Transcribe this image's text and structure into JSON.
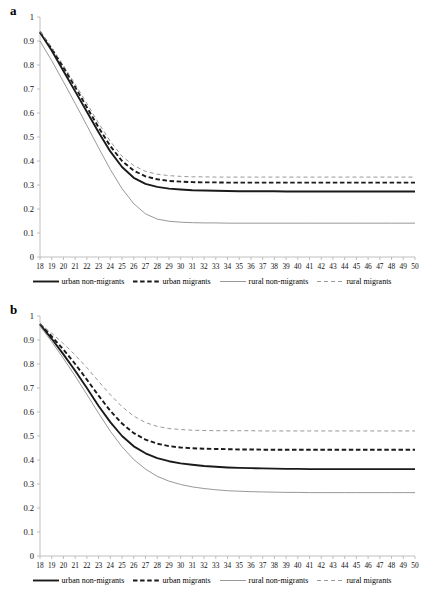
{
  "figure": {
    "panels": [
      {
        "label": "a"
      },
      {
        "label": "b"
      }
    ]
  },
  "legend": {
    "entries": [
      {
        "label": "urban non-migrants",
        "style": "solid",
        "color": "#1a1a1a",
        "width": 1.9
      },
      {
        "label": "urban migrants",
        "style": "dashed",
        "color": "#1a1a1a",
        "width": 1.9
      },
      {
        "label": "rural non-migrants",
        "style": "solid",
        "color": "#8c8c8c",
        "width": 0.9
      },
      {
        "label": "rural migrants",
        "style": "dashed",
        "color": "#8c8c8c",
        "width": 0.9
      }
    ]
  },
  "chart_data": [
    {
      "type": "line",
      "title": "a",
      "xlabel": "",
      "ylabel": "",
      "xlim": [
        18,
        50
      ],
      "ylim": [
        0,
        1
      ],
      "grid": false,
      "legend_position": "bottom",
      "xticks": [
        18,
        19,
        20,
        21,
        22,
        23,
        24,
        25,
        26,
        27,
        28,
        29,
        30,
        31,
        32,
        33,
        34,
        35,
        36,
        37,
        38,
        39,
        40,
        41,
        42,
        43,
        44,
        45,
        46,
        47,
        48,
        49,
        50
      ],
      "yticks": [
        0,
        0.1,
        0.2,
        0.3,
        0.4,
        0.5,
        0.6,
        0.7,
        0.8,
        0.9,
        1
      ],
      "x": [
        18,
        19,
        20,
        21,
        22,
        23,
        24,
        25,
        26,
        27,
        28,
        29,
        30,
        31,
        32,
        33,
        34,
        35,
        36,
        37,
        38,
        39,
        40,
        41,
        42,
        43,
        44,
        45,
        46,
        47,
        48,
        49,
        50
      ],
      "series": [
        {
          "name": "urban non-migrants",
          "style": "solid",
          "color": "#1a1a1a",
          "values": [
            0.935,
            0.86,
            0.775,
            0.69,
            0.605,
            0.52,
            0.44,
            0.375,
            0.33,
            0.305,
            0.292,
            0.285,
            0.281,
            0.278,
            0.277,
            0.276,
            0.275,
            0.274,
            0.274,
            0.274,
            0.274,
            0.273,
            0.273,
            0.273,
            0.273,
            0.273,
            0.273,
            0.273,
            0.273,
            0.273,
            0.273,
            0.273,
            0.273
          ]
        },
        {
          "name": "urban migrants",
          "style": "dashed",
          "color": "#1a1a1a",
          "values": [
            0.938,
            0.868,
            0.79,
            0.708,
            0.624,
            0.54,
            0.462,
            0.4,
            0.36,
            0.336,
            0.324,
            0.317,
            0.314,
            0.312,
            0.311,
            0.311,
            0.31,
            0.31,
            0.31,
            0.31,
            0.31,
            0.31,
            0.31,
            0.31,
            0.31,
            0.31,
            0.31,
            0.31,
            0.31,
            0.31,
            0.31,
            0.31,
            0.31
          ]
        },
        {
          "name": "rural non-migrants",
          "style": "solid",
          "color": "#8c8c8c",
          "values": [
            0.9,
            0.818,
            0.73,
            0.64,
            0.548,
            0.455,
            0.365,
            0.285,
            0.222,
            0.18,
            0.158,
            0.149,
            0.145,
            0.143,
            0.142,
            0.142,
            0.141,
            0.141,
            0.141,
            0.141,
            0.141,
            0.141,
            0.141,
            0.141,
            0.141,
            0.141,
            0.141,
            0.141,
            0.141,
            0.141,
            0.141,
            0.141,
            0.141
          ]
        },
        {
          "name": "rural migrants",
          "style": "dashed",
          "color": "#8c8c8c",
          "values": [
            0.94,
            0.872,
            0.798,
            0.72,
            0.64,
            0.558,
            0.482,
            0.42,
            0.381,
            0.357,
            0.345,
            0.339,
            0.336,
            0.334,
            0.334,
            0.333,
            0.333,
            0.333,
            0.333,
            0.333,
            0.333,
            0.333,
            0.333,
            0.333,
            0.333,
            0.333,
            0.333,
            0.333,
            0.333,
            0.333,
            0.333,
            0.333,
            0.333
          ]
        }
      ]
    },
    {
      "type": "line",
      "title": "b",
      "xlabel": "",
      "ylabel": "",
      "xlim": [
        18,
        50
      ],
      "ylim": [
        0,
        1
      ],
      "grid": false,
      "legend_position": "bottom",
      "xticks": [
        18,
        19,
        20,
        21,
        22,
        23,
        24,
        25,
        26,
        27,
        28,
        29,
        30,
        31,
        32,
        33,
        34,
        35,
        36,
        37,
        38,
        39,
        40,
        41,
        42,
        43,
        44,
        45,
        46,
        47,
        48,
        49,
        50
      ],
      "yticks": [
        0,
        0.1,
        0.2,
        0.3,
        0.4,
        0.5,
        0.6,
        0.7,
        0.8,
        0.9,
        1
      ],
      "x": [
        18,
        19,
        20,
        21,
        22,
        23,
        24,
        25,
        26,
        27,
        28,
        29,
        30,
        31,
        32,
        33,
        34,
        35,
        36,
        37,
        38,
        39,
        40,
        41,
        42,
        43,
        44,
        45,
        46,
        47,
        48,
        49,
        50
      ],
      "series": [
        {
          "name": "urban non-migrants",
          "style": "solid",
          "color": "#1a1a1a",
          "values": [
            0.965,
            0.905,
            0.84,
            0.772,
            0.7,
            0.625,
            0.558,
            0.5,
            0.457,
            0.428,
            0.408,
            0.395,
            0.386,
            0.38,
            0.375,
            0.372,
            0.369,
            0.367,
            0.366,
            0.365,
            0.364,
            0.363,
            0.363,
            0.362,
            0.362,
            0.362,
            0.362,
            0.362,
            0.362,
            0.362,
            0.362,
            0.362,
            0.362
          ]
        },
        {
          "name": "urban migrants",
          "style": "dashed",
          "color": "#1a1a1a",
          "values": [
            0.967,
            0.915,
            0.86,
            0.8,
            0.735,
            0.668,
            0.605,
            0.552,
            0.512,
            0.485,
            0.468,
            0.458,
            0.452,
            0.449,
            0.447,
            0.446,
            0.445,
            0.444,
            0.444,
            0.443,
            0.443,
            0.443,
            0.443,
            0.443,
            0.443,
            0.443,
            0.443,
            0.443,
            0.443,
            0.443,
            0.443,
            0.443,
            0.443
          ]
        },
        {
          "name": "rural non-migrants",
          "style": "solid",
          "color": "#8c8c8c",
          "values": [
            0.958,
            0.893,
            0.823,
            0.75,
            0.673,
            0.595,
            0.52,
            0.455,
            0.402,
            0.362,
            0.332,
            0.312,
            0.298,
            0.288,
            0.281,
            0.276,
            0.272,
            0.27,
            0.268,
            0.267,
            0.266,
            0.265,
            0.265,
            0.264,
            0.264,
            0.264,
            0.264,
            0.264,
            0.264,
            0.264,
            0.264,
            0.264,
            0.264
          ]
        },
        {
          "name": "rural migrants",
          "style": "dashed",
          "color": "#8c8c8c",
          "values": [
            0.968,
            0.928,
            0.885,
            0.837,
            0.785,
            0.728,
            0.672,
            0.622,
            0.583,
            0.556,
            0.54,
            0.531,
            0.527,
            0.524,
            0.523,
            0.522,
            0.522,
            0.522,
            0.522,
            0.521,
            0.521,
            0.521,
            0.521,
            0.521,
            0.521,
            0.521,
            0.521,
            0.521,
            0.521,
            0.521,
            0.521,
            0.521,
            0.521
          ]
        }
      ]
    }
  ]
}
